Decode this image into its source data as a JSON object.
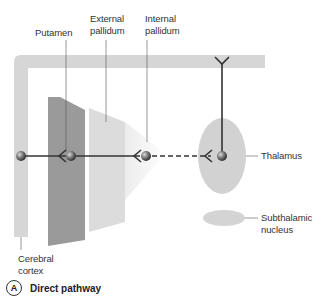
{
  "labels": {
    "putamen": "Putamen",
    "external_pallidum": [
      "External",
      "pallidum"
    ],
    "internal_pallidum": [
      "Internal",
      "pallidum"
    ],
    "thalamus": "Thalamus",
    "subthalamic_nucleus": [
      "Subthalamic",
      "nucleus"
    ],
    "cerebral_cortex": [
      "Cerebral",
      "cortex"
    ]
  },
  "caption": {
    "letter": "A",
    "title": "Direct pathway"
  },
  "colors": {
    "cortex": "#d6d6d6",
    "putamen": "#9a9a9a",
    "external_pallidum": "#dcdcdc",
    "internal_pallidum": "#f0f0f0",
    "thalamus": "#d2d2d2",
    "subthalamic": "#d2d2d2",
    "pathway_line": "#333333"
  }
}
